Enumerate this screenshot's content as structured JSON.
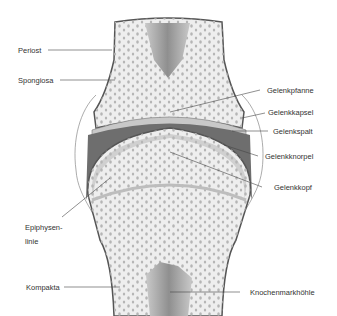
{
  "diagram": {
    "colors": {
      "bone": "#eeeeee",
      "outline": "#555555",
      "cartilage": "#c8c8c8",
      "capsule": "#6e6e6e",
      "marrow": "#9a9a9a",
      "pores": "#b5b5b5",
      "leader": "#444444"
    },
    "labels_left": [
      {
        "id": "periost",
        "text": "Periost"
      },
      {
        "id": "spongiosa",
        "text": "Spongiosa"
      },
      {
        "id": "epiphysenlinie",
        "text": "Epiphysen-",
        "text2": "linie"
      },
      {
        "id": "kompakta",
        "text": "Kompakta"
      }
    ],
    "labels_right": [
      {
        "id": "gelenkpfanne",
        "text": "Gelenkpfanne"
      },
      {
        "id": "gelenkkapsel",
        "text": "Gelenkkapsel"
      },
      {
        "id": "gelenkspalt",
        "text": "Gelenkspalt"
      },
      {
        "id": "gelenkknorpel",
        "text": "Gelenkknorpel"
      },
      {
        "id": "gelenkkopf",
        "text": "Gelenkkopf"
      },
      {
        "id": "knochenmarkhoehle",
        "text": "Knochenmarkhöhle"
      }
    ]
  }
}
